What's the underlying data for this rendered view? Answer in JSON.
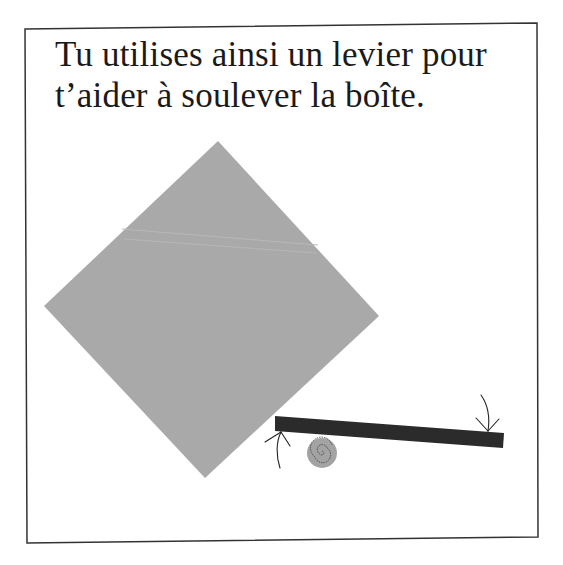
{
  "caption": {
    "line1": "Tu utilises ainsi un levier pour",
    "line2": "t’aider à soulever la boîte."
  },
  "illustration": {
    "box": {
      "shape": "rotated-square",
      "color": "#a9a9a9"
    },
    "lever": {
      "shape": "bar",
      "color": "#2b2b2b"
    },
    "fulcrum": {
      "shape": "spiral-disc",
      "color": "#a3a3a3"
    },
    "arrows": [
      {
        "name": "up-force-arrow",
        "direction": "up"
      },
      {
        "name": "down-force-arrow",
        "direction": "down"
      }
    ]
  },
  "colors": {
    "frame": "#333333",
    "box": "#a9a9a9",
    "lever": "#2b2b2b",
    "text": "#1a1a1a"
  }
}
